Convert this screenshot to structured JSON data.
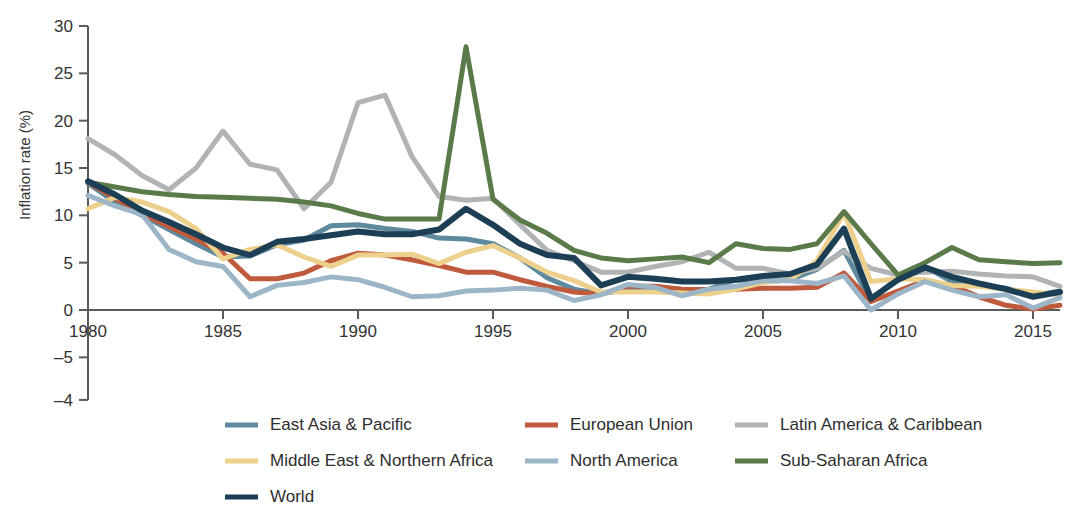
{
  "chart_data": {
    "type": "line",
    "title": "",
    "xlabel": "",
    "ylabel": "Inflation rate (%)",
    "xlim": [
      1980,
      2016
    ],
    "ylim": [
      -4,
      30
    ],
    "grid": false,
    "legend_position": "bottom",
    "x_ticks": [
      "1980",
      "1985",
      "1990",
      "1995",
      "2000",
      "2005",
      "2010",
      "2015"
    ],
    "x_tick_values": [
      1980,
      1985,
      1990,
      1995,
      2000,
      2005,
      2010,
      2015
    ],
    "y_ticks": [
      "30",
      "25",
      "20",
      "15",
      "10",
      "5",
      "0",
      "–5",
      "–4"
    ],
    "y_tick_values": [
      30,
      25,
      20,
      15,
      10,
      5,
      0,
      -5,
      -9.5
    ],
    "x": [
      1980,
      1981,
      1982,
      1983,
      1984,
      1985,
      1986,
      1987,
      1988,
      1989,
      1990,
      1991,
      1992,
      1993,
      1994,
      1995,
      1996,
      1997,
      1998,
      1999,
      2000,
      2001,
      2002,
      2003,
      2004,
      2005,
      2006,
      2007,
      2008,
      2009,
      2010,
      2011,
      2012,
      2013,
      2014,
      2015,
      2016
    ],
    "series": [
      {
        "name": "East Asia & Pacific",
        "color": "#5d8a9c",
        "width": 5,
        "values": [
          13.4,
          11.4,
          10.0,
          8.5,
          7.0,
          5.6,
          5.7,
          6.9,
          7.4,
          8.9,
          9.0,
          8.6,
          8.3,
          7.6,
          7.5,
          7.0,
          5.5,
          3.4,
          2.2,
          1.7,
          2.2,
          2.3,
          2.1,
          2.2,
          3.2,
          3.0,
          3.2,
          4.3,
          6.3,
          0.9,
          3.5,
          4.6,
          3.0,
          2.6,
          2.3,
          1.5,
          2.0
        ]
      },
      {
        "name": "European Union",
        "color": "#c05a3c",
        "width": 5,
        "values": [
          13.5,
          11.8,
          10.2,
          8.8,
          7.5,
          6.0,
          3.3,
          3.3,
          3.9,
          5.2,
          6.0,
          5.8,
          5.3,
          4.7,
          4.0,
          4.0,
          3.2,
          2.5,
          1.9,
          1.7,
          2.5,
          2.5,
          2.2,
          2.1,
          2.2,
          2.3,
          2.3,
          2.4,
          3.9,
          0.9,
          2.0,
          3.1,
          2.6,
          1.4,
          0.5,
          0.1,
          0.5
        ]
      },
      {
        "name": "Latin America & Caribbean",
        "color": "#b0b4b4",
        "width": 5,
        "values": [
          18.1,
          16.4,
          14.2,
          12.7,
          15.0,
          18.9,
          15.4,
          14.8,
          10.7,
          13.5,
          21.9,
          22.7,
          16.2,
          12.0,
          11.6,
          11.8,
          9.0,
          6.3,
          5.2,
          4.0,
          4.0,
          4.6,
          5.1,
          6.1,
          4.4,
          4.4,
          3.8,
          4.4,
          6.2,
          4.4,
          3.7,
          4.0,
          4.1,
          3.8,
          3.6,
          3.5,
          2.5
        ]
      },
      {
        "name": "Middle East & Northern Africa",
        "color": "#ecd08c",
        "width": 5,
        "values": [
          10.7,
          11.9,
          11.4,
          10.4,
          8.6,
          5.4,
          6.4,
          6.9,
          5.6,
          4.6,
          5.8,
          5.8,
          5.9,
          4.9,
          6.1,
          6.8,
          5.5,
          4.0,
          3.1,
          1.9,
          1.9,
          1.9,
          1.8,
          1.7,
          2.2,
          2.9,
          3.2,
          5.2,
          10.3,
          3.0,
          3.3,
          3.2,
          2.6,
          2.5,
          2.2,
          1.9,
          1.6
        ]
      },
      {
        "name": "North America",
        "color": "#9cb6c8",
        "width": 5,
        "values": [
          12.1,
          11.0,
          10.1,
          6.4,
          5.1,
          4.6,
          1.4,
          2.6,
          2.9,
          3.5,
          3.2,
          2.4,
          1.4,
          1.5,
          2.0,
          2.1,
          2.3,
          2.1,
          1.0,
          1.6,
          2.7,
          2.4,
          1.5,
          2.2,
          2.5,
          3.1,
          3.1,
          2.8,
          3.6,
          0.0,
          1.7,
          3.0,
          2.1,
          1.4,
          1.6,
          0.2,
          1.3
        ]
      },
      {
        "name": "Sub-Saharan Africa",
        "color": "#5b7a4a",
        "width": 5,
        "values": [
          13.5,
          13.0,
          12.5,
          12.2,
          12.0,
          11.9,
          11.8,
          11.7,
          11.4,
          11.0,
          10.2,
          9.6,
          9.6,
          9.6,
          27.8,
          11.7,
          9.5,
          8.1,
          6.3,
          5.5,
          5.2,
          5.4,
          5.6,
          5.0,
          7.0,
          6.5,
          6.4,
          7.0,
          10.4,
          7.0,
          3.7,
          5.0,
          6.6,
          5.3,
          5.1,
          4.9,
          5.0
        ]
      },
      {
        "name": "World",
        "color": "#1c3f56",
        "width": 6,
        "values": [
          13.6,
          12.2,
          10.5,
          9.3,
          8.0,
          6.6,
          5.8,
          7.2,
          7.5,
          7.9,
          8.3,
          8.0,
          8.0,
          8.5,
          10.7,
          9.0,
          7.0,
          5.8,
          5.5,
          2.6,
          3.5,
          3.3,
          3.0,
          3.0,
          3.2,
          3.6,
          3.8,
          4.8,
          8.6,
          1.2,
          3.2,
          4.5,
          3.5,
          2.8,
          2.2,
          1.4,
          1.9
        ]
      }
    ],
    "legend": [
      {
        "label": "East Asia & Pacific",
        "color": "#5d8a9c"
      },
      {
        "label": "European Union",
        "color": "#c05a3c"
      },
      {
        "label": "Latin America & Caribbean",
        "color": "#b0b4b4"
      },
      {
        "label": "Middle East & Northern Africa",
        "color": "#ecd08c"
      },
      {
        "label": "North America",
        "color": "#9cb6c8"
      },
      {
        "label": "Sub-Saharan Africa",
        "color": "#5b7a4a"
      },
      {
        "label": "World",
        "color": "#1c3f56"
      }
    ]
  }
}
